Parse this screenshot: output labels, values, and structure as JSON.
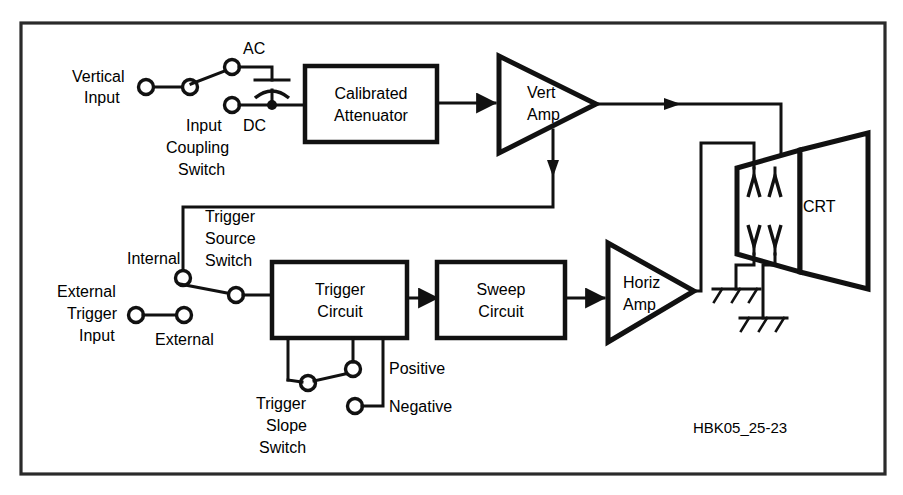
{
  "diagram": {
    "figure_code": "HBK05_25-23",
    "colors": {
      "line": "#111111",
      "background": "#ffffff",
      "border": "#2a2a2a"
    },
    "labels": {
      "vertical_input": "Vertical\nInput",
      "vertical_input_line1": "Vertical",
      "vertical_input_line2": "Input",
      "input_coupling_switch_line1": "Input",
      "input_coupling_switch_line2": "Coupling",
      "input_coupling_switch_line3": "Switch",
      "ac": "AC",
      "dc": "DC",
      "calibrated_attenuator_line1": "Calibrated",
      "calibrated_attenuator_line2": "Attenuator",
      "vert_amp_line1": "Vert",
      "vert_amp_line2": "Amp",
      "crt": "CRT",
      "internal": "Internal",
      "external": "External",
      "external_trigger_input_line1": "External",
      "external_trigger_input_line2": "Trigger",
      "external_trigger_input_line3": "Input",
      "trigger_source_switch_line1": "Trigger",
      "trigger_source_switch_line2": "Source",
      "trigger_source_switch_line3": "Switch",
      "trigger_circuit_line1": "Trigger",
      "trigger_circuit_line2": "Circuit",
      "sweep_circuit_line1": "Sweep",
      "sweep_circuit_line2": "Circuit",
      "horiz_amp_line1": "Horiz",
      "horiz_amp_line2": "Amp",
      "positive": "Positive",
      "negative": "Negative",
      "trigger_slope_switch_line1": "Trigger",
      "trigger_slope_switch_line2": "Slope",
      "trigger_slope_switch_line3": "Switch"
    },
    "blocks": [
      {
        "id": "calibrated-attenuator",
        "label_line1": "Calibrated",
        "label_line2": "Attenuator",
        "shape": "rectangle"
      },
      {
        "id": "vert-amp",
        "label_line1": "Vert",
        "label_line2": "Amp",
        "shape": "triangle"
      },
      {
        "id": "crt",
        "label": "CRT",
        "shape": "trapezoid"
      },
      {
        "id": "trigger-circuit",
        "label_line1": "Trigger",
        "label_line2": "Circuit",
        "shape": "rectangle"
      },
      {
        "id": "sweep-circuit",
        "label_line1": "Sweep",
        "label_line2": "Circuit",
        "shape": "rectangle"
      },
      {
        "id": "horiz-amp",
        "label_line1": "Horiz",
        "label_line2": "Amp",
        "shape": "triangle"
      }
    ],
    "switches": [
      {
        "id": "input-coupling-switch",
        "positions": [
          "AC",
          "DC"
        ],
        "selected": "AC"
      },
      {
        "id": "trigger-source-switch",
        "positions": [
          "Internal",
          "External"
        ],
        "selected": "Internal"
      },
      {
        "id": "trigger-slope-switch",
        "positions": [
          "Positive",
          "Negative"
        ],
        "selected": "Positive"
      }
    ]
  }
}
